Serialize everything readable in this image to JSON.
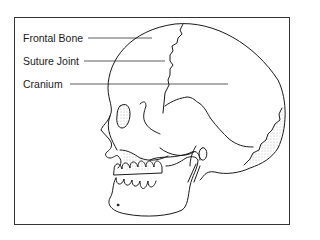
{
  "diagram": {
    "labels": [
      {
        "id": "frontal-bone",
        "text": "Frontal Bone",
        "x": 23,
        "y": 32,
        "line": [
          88,
          38,
          152,
          38
        ]
      },
      {
        "id": "suture-joint",
        "text": "Suture Joint",
        "x": 23,
        "y": 55,
        "line": [
          84,
          61,
          165,
          61
        ]
      },
      {
        "id": "cranium",
        "text": "Cranium",
        "x": 23,
        "y": 78,
        "line": [
          70,
          84,
          228,
          84
        ]
      }
    ],
    "colors": {
      "stroke": "#1a1a1a",
      "frame": "#333333",
      "background": "#ffffff",
      "stipple": "#777777"
    }
  }
}
